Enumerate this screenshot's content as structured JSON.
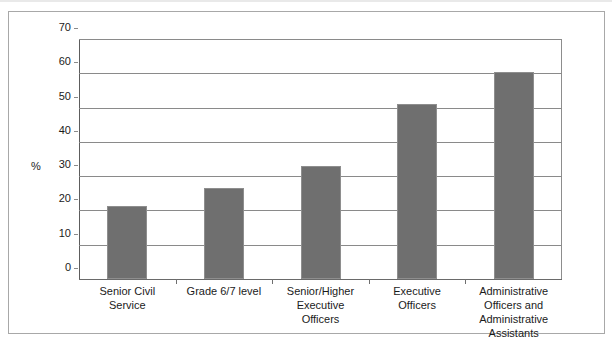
{
  "chart_data": {
    "type": "bar",
    "title": "",
    "subtitle": "",
    "xlabel": "",
    "ylabel": "%",
    "ylim": [
      0,
      70
    ],
    "yticks": [
      0,
      10,
      20,
      30,
      40,
      50,
      60,
      70
    ],
    "ytick_labels": [
      "0",
      "10",
      "20",
      "30",
      "40",
      "50",
      "60",
      "70"
    ],
    "grid": true,
    "legend": null,
    "legend_position": "none",
    "categories": [
      "Senior Civil Service",
      "Grade 6/7 level",
      "Senior/Higher Executive Officers",
      "Executive Officers",
      "Administrative Officers and Administrative Assistants"
    ],
    "category_lines": [
      [
        "Senior Civil",
        "Service"
      ],
      [
        "Grade 6/7 level"
      ],
      [
        "Senior/Higher",
        "Executive",
        "Officers"
      ],
      [
        "Executive",
        "Officers"
      ],
      [
        "Administrative",
        "Officers and",
        "Administrative",
        "Assistants"
      ]
    ],
    "values": [
      21.2,
      26.5,
      33.0,
      50.9,
      60.5
    ],
    "bar_color": "#6f6f6f",
    "bar_edge_color": "#8e8e8e",
    "axis_color": "#6a6a6a",
    "grid_color": "#8a8a8a",
    "frame_color": "#a8a8a8",
    "text_color": "#1b1b1b",
    "background": "#ffffff"
  },
  "axis": {
    "y_title": "%"
  }
}
